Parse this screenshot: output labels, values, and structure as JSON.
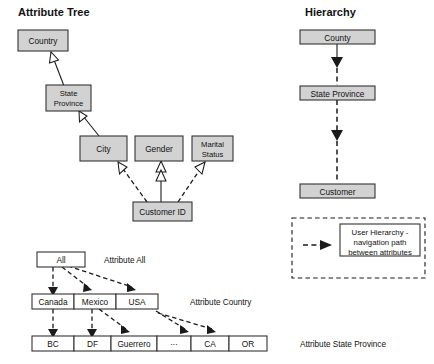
{
  "titles": {
    "attribute_tree": "Attribute Tree",
    "hierarchy": "Hierarchy"
  },
  "attribute_tree": {
    "nodes": [
      {
        "id": "country",
        "label": "Country"
      },
      {
        "id": "state-province",
        "label_line1": "State",
        "label_line2": "Province"
      },
      {
        "id": "city",
        "label": "City"
      },
      {
        "id": "gender",
        "label": "Gender"
      },
      {
        "id": "marital-status",
        "label_line1": "Marital",
        "label_line2": "Status"
      },
      {
        "id": "customer-id",
        "label": "Customer ID"
      }
    ],
    "edges": [
      {
        "from": "state-province",
        "to": "country",
        "style": "solid",
        "head": "hollow"
      },
      {
        "from": "city",
        "to": "state-province",
        "style": "solid",
        "head": "hollow"
      },
      {
        "from": "customer-id",
        "to": "city",
        "style": "dashed",
        "head": "hollow"
      },
      {
        "from": "customer-id",
        "to": "gender",
        "style": "solid",
        "head": "hollow"
      },
      {
        "from": "customer-id",
        "to": "marital-status",
        "style": "dashed",
        "head": "hollow"
      }
    ]
  },
  "hierarchy": {
    "nodes": [
      {
        "id": "county",
        "label": "County"
      },
      {
        "id": "state-province",
        "label": "State Province"
      },
      {
        "id": "customer",
        "label": "Customer"
      }
    ],
    "edges": [
      {
        "from": "county",
        "to": "state-province",
        "style": "dashed",
        "head": "solid"
      },
      {
        "from": "state-province",
        "to": "customer",
        "style": "dashed",
        "head": "solid"
      }
    ]
  },
  "legend": {
    "text_line1": "User Hierarchy -",
    "text_line2": "navigation path",
    "text_line3": "between attributes"
  },
  "member_tree": {
    "levels": [
      {
        "id": "attribute-all",
        "annotation": "Attribute All",
        "members": [
          {
            "label": "All"
          }
        ]
      },
      {
        "id": "attribute-country",
        "annotation": "Attribute Country",
        "members": [
          {
            "label": "Canada"
          },
          {
            "label": "Mexico"
          },
          {
            "label": "USA"
          }
        ]
      },
      {
        "id": "attribute-state-province",
        "annotation": "Attribute State Province",
        "members": [
          {
            "label": "BC"
          },
          {
            "label": "DF"
          },
          {
            "label": "Guerrero"
          },
          {
            "label": "..."
          },
          {
            "label": "CA"
          },
          {
            "label": "OR"
          }
        ]
      }
    ]
  },
  "colors": {
    "node_fill": "#d2d2d2",
    "node_stroke": "#333333",
    "line": "#1a1a1a",
    "text": "#111111",
    "background": "#ffffff"
  }
}
